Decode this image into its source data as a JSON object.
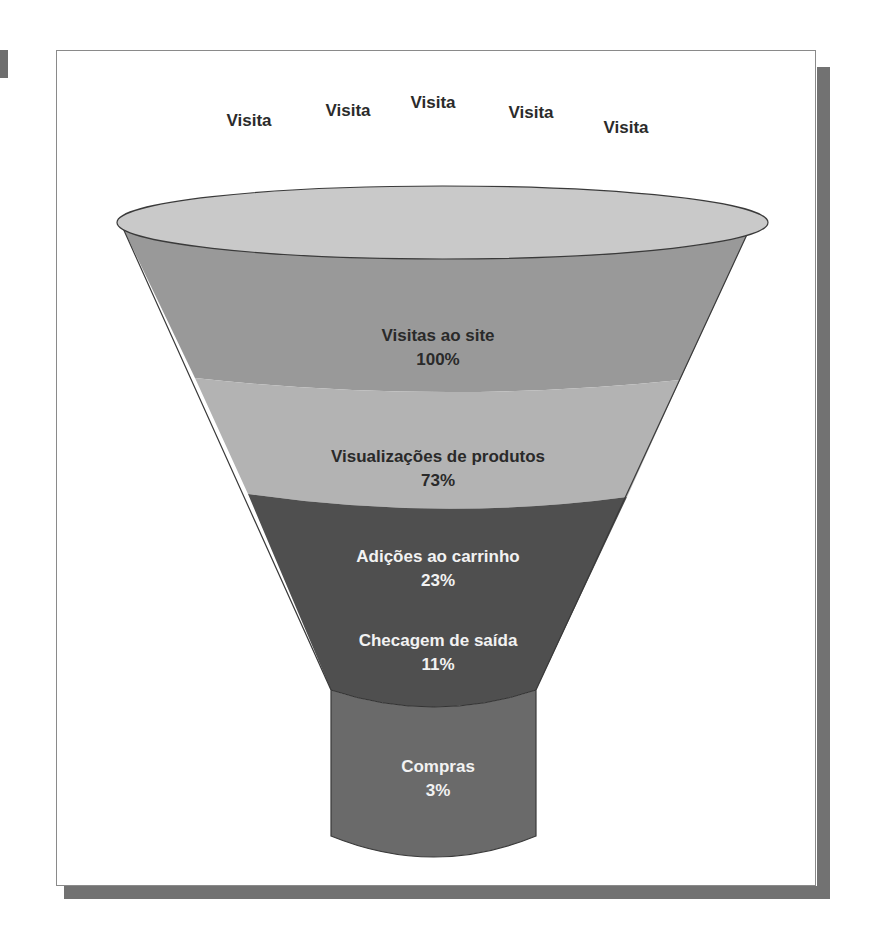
{
  "diagram": {
    "type": "conversion-funnel",
    "visit_labels": [
      {
        "text": "Visita",
        "x": 249,
        "y": 121
      },
      {
        "text": "Visita",
        "x": 348,
        "y": 111
      },
      {
        "text": "Visita",
        "x": 433,
        "y": 103
      },
      {
        "text": "Visita",
        "x": 531,
        "y": 113
      },
      {
        "text": "Visita",
        "x": 626,
        "y": 128
      }
    ],
    "stages": [
      {
        "name": "Visitas ao site",
        "value": "100%",
        "color": "#999999",
        "text_color": "#2a2a2a"
      },
      {
        "name": "Visualizações de produtos",
        "value": "73%",
        "color": "#b3b3b3",
        "text_color": "#2a2a2a"
      },
      {
        "name": "Adições ao carrinho",
        "value": "23%",
        "color": "#4f4f4f",
        "text_color": "#f2f2f2"
      },
      {
        "name": "Checagem de saída",
        "value": "11%",
        "color": "#4f4f4f",
        "text_color": "#f2f2f2"
      },
      {
        "name": "Compras",
        "value": "3%",
        "color": "#6a6a6a",
        "text_color": "#f2f2f2"
      }
    ],
    "colors": {
      "funnel_top": "#c9c9c9",
      "outline": "#3a3a3a",
      "frame_shadow": "#727272"
    }
  }
}
